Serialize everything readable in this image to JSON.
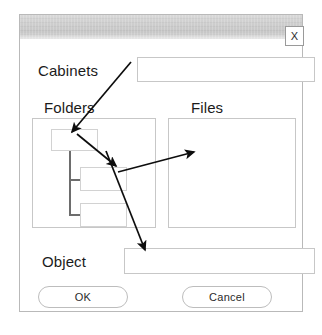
{
  "window": {
    "title": "",
    "close_label": "X",
    "accent_border": "#c7c7c7",
    "titlebar_color": "#cdcdcd"
  },
  "fields": {
    "cabinets": {
      "label": "Cabinets",
      "value": "",
      "placeholder": ""
    },
    "object": {
      "label": "Object",
      "value": "",
      "placeholder": ""
    }
  },
  "panes": {
    "folders": {
      "label": "Folders",
      "items": [
        {
          "name": "folder-node-root"
        },
        {
          "name": "folder-node-child-1"
        },
        {
          "name": "folder-node-child-2"
        }
      ]
    },
    "files": {
      "label": "Files",
      "items": []
    }
  },
  "buttons": {
    "ok": "OK",
    "cancel": "Cancel"
  },
  "annotations": {
    "arrow_color": "#0d0d0d",
    "arrows": [
      {
        "name": "arrow-cabinets-to-folder-root",
        "from": [
          131,
          62
        ],
        "to": [
          72,
          132
        ]
      },
      {
        "name": "arrow-folder-root-to-child",
        "from": [
          77,
          134
        ],
        "to": [
          116,
          166
        ]
      },
      {
        "name": "arrow-folder-child-to-files",
        "from": [
          118,
          172
        ],
        "to": [
          194,
          152
        ]
      },
      {
        "name": "arrow-folder-child-to-object",
        "from": [
          106,
          151
        ],
        "to": [
          145,
          250
        ]
      }
    ]
  },
  "caption": {
    "text": ""
  }
}
